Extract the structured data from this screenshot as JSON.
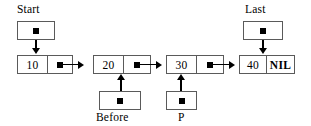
{
  "diagram": {
    "type": "singly-linked-list",
    "background_color": "#ffffff",
    "line_color": "#000000",
    "box_border_color": "#5a5a5a",
    "nodes": [
      {
        "value": "10",
        "pointer_mark": "square-dot",
        "next": "20"
      },
      {
        "value": "20",
        "pointer_mark": "square-dot",
        "next": "30"
      },
      {
        "value": "30",
        "pointer_mark": "square-dot",
        "next": "40"
      },
      {
        "value": "40",
        "pointer_mark": "NIL",
        "next": null
      }
    ],
    "pointer_variables": [
      {
        "name": "Start",
        "label_position": "above",
        "points_to": "10",
        "mark": "square-dot"
      },
      {
        "name": "Last",
        "label_position": "above",
        "points_to": "40",
        "mark": "square-dot"
      },
      {
        "name": "Before",
        "label_position": "below",
        "points_to": "20",
        "mark": "square-dot"
      },
      {
        "name": "P",
        "label_position": "below",
        "points_to": "30",
        "mark": "square-dot"
      }
    ],
    "nil_label": "NIL"
  }
}
